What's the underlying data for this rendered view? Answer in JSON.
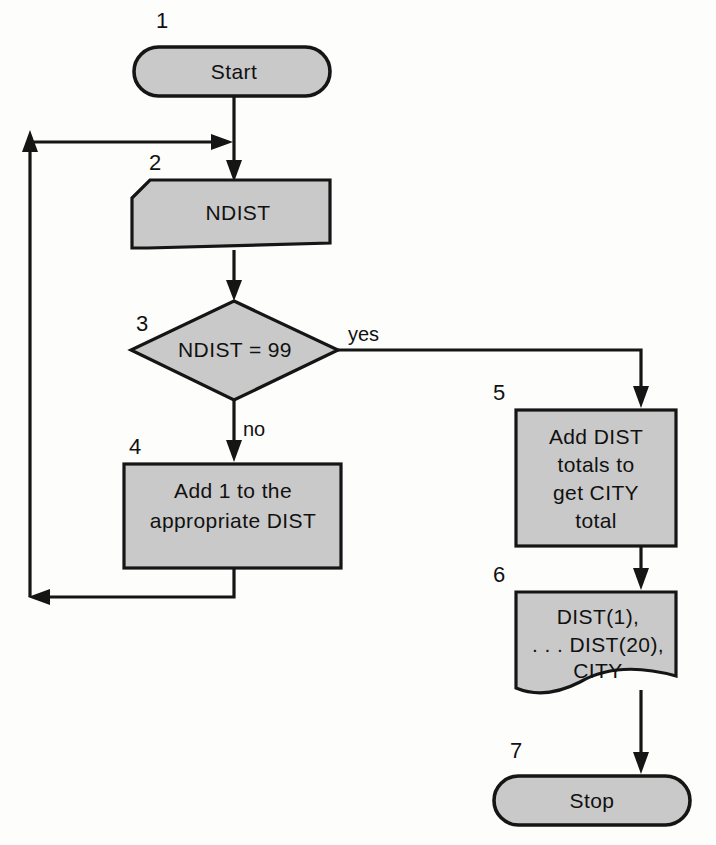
{
  "diagram": {
    "type": "program-flowchart",
    "fill_color": "#c9c9c9",
    "line_color": "#151515",
    "background_color": "#fdfdfc",
    "nodes": [
      {
        "id": "n1",
        "number": "1",
        "shape": "terminator",
        "lines": [
          "Start"
        ],
        "text": "Start"
      },
      {
        "id": "n2",
        "number": "2",
        "shape": "punched-card-input",
        "lines": [
          "NDIST"
        ],
        "text": "NDIST"
      },
      {
        "id": "n3",
        "number": "3",
        "shape": "decision",
        "lines": [
          "NDIST = 99"
        ],
        "text": "NDIST = 99"
      },
      {
        "id": "n4",
        "number": "4",
        "shape": "process",
        "lines": [
          "Add 1 to the",
          "appropriate DIST"
        ],
        "text": "Add 1 to the appropriate DIST"
      },
      {
        "id": "n5",
        "number": "5",
        "shape": "process",
        "lines": [
          "Add DIST",
          "totals to",
          "get CITY",
          "total"
        ],
        "text": "Add DIST totals to get CITY total"
      },
      {
        "id": "n6",
        "number": "6",
        "shape": "document-output",
        "lines": [
          "DIST(1),",
          ". . . DIST(20),",
          "CITY"
        ],
        "text": "DIST(1), . . . DIST(20), CITY"
      },
      {
        "id": "n7",
        "number": "7",
        "shape": "terminator",
        "lines": [
          "Stop"
        ],
        "text": "Stop"
      }
    ],
    "edge_labels": {
      "yes": "yes",
      "no": "no"
    }
  }
}
